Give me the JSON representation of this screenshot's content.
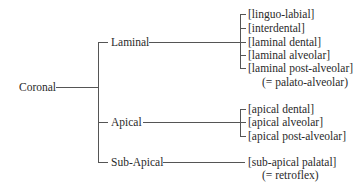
{
  "root": {
    "label": "Coronal"
  },
  "branches": [
    {
      "label": "Laminal",
      "children": [
        "[linguo-labial]",
        "[interdental]",
        "[laminal dental]",
        "[laminal alveolar]",
        "[laminal post-alveolar]"
      ],
      "note": "(= palato-alveolar)"
    },
    {
      "label": "Apical",
      "children": [
        "[apical dental]",
        "[apical alveolar]",
        "[apical post-alveolar]"
      ]
    },
    {
      "label": "Sub-Apical",
      "children": [
        "[sub-apical palatal]"
      ],
      "note": "(= retroflex)"
    }
  ]
}
